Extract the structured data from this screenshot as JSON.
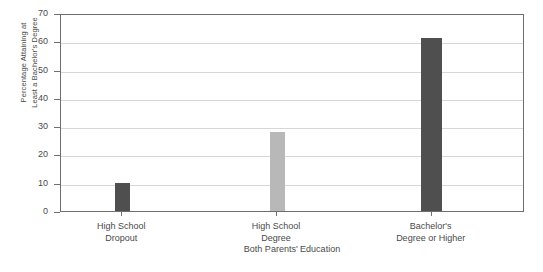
{
  "chart_data": {
    "type": "bar",
    "title": "",
    "categories": [
      "High School Dropout",
      "High School Degree",
      "Bachelor's Degree or Higher"
    ],
    "category_lines": [
      [
        "High School",
        "Dropout"
      ],
      [
        "High School",
        "Degree"
      ],
      [
        "Bachelor's",
        "Degree or Higher"
      ]
    ],
    "values": [
      10,
      28,
      61
    ],
    "xlabel": "Both Parents' Education",
    "ylabel_line1": "Percentage Attaining at",
    "ylabel_line2": "Least a Bachelor's Degree",
    "ylim": [
      0,
      70
    ],
    "yticks": [
      0,
      10,
      20,
      30,
      40,
      50,
      60,
      70
    ],
    "ytick_labels": [
      "0",
      "10",
      "20",
      "30",
      "40",
      "50",
      "60",
      "70"
    ],
    "grid": true,
    "grid_axis": "y",
    "legend": false,
    "bar_colors": [
      "#4f4f4f",
      "#b8b8b8",
      "#4f4f4f"
    ],
    "frame_color": "#6e6e6e",
    "gridline_color": "#d7d7d7",
    "background": "#ffffff"
  }
}
